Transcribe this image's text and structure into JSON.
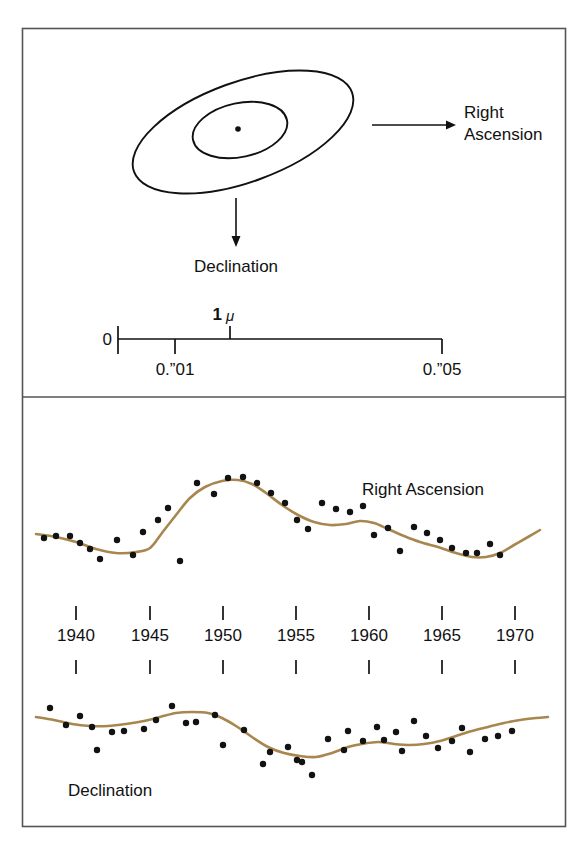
{
  "figure": {
    "background_color": "#ffffff",
    "frame_color": "#4a4a4a",
    "ink_color": "#111111",
    "curve_color": "#a8874f",
    "point_color": "#121212"
  },
  "top_panel": {
    "name": "error-ellipse-diagram",
    "right_ascension_label": "Right",
    "right_ascension_label_line2": "Ascension",
    "declination_label": "Declination",
    "ellipse_outer": {
      "cx": 243,
      "cy": 132,
      "rx": 116,
      "ry": 50,
      "rotation_deg": -20
    },
    "ellipse_inner": {
      "cx": 240,
      "cy": 130,
      "rx": 48,
      "ry": 27,
      "rotation_deg": -12
    },
    "center_dot": {
      "cx": 238,
      "cy": 129,
      "r": 3
    },
    "ra_arrow": {
      "x1": 372,
      "y1": 125,
      "x2": 452,
      "y2": 125
    },
    "dec_arrow": {
      "x1": 236,
      "y1": 198,
      "x2": 236,
      "y2": 243
    },
    "scalebar": {
      "zero_label": "0",
      "mu_label": "1",
      "mu_symbol": "μ",
      "tick_01_label": "0.”01",
      "tick_05_label": "0.”05",
      "x_start": 118,
      "x_end": 442,
      "y": 339
    }
  },
  "divider": {
    "y": 397
  },
  "bottom_panel": {
    "name": "proper-motion-time-series",
    "ra_series_label": "Right Ascension",
    "dec_series_label": "Declination",
    "axis": {
      "tick_labels": [
        "1940",
        "1945",
        "1950",
        "1955",
        "1960",
        "1965",
        "1970"
      ],
      "tick_x": [
        76,
        150,
        223,
        296,
        369,
        442,
        515
      ],
      "label_y": 641,
      "tick_top_y1": 606,
      "tick_top_y2": 620,
      "tick_bottom_y1": 660,
      "tick_bottom_y2": 674
    }
  },
  "chart_data": {
    "type": "scatter",
    "title": "",
    "subtitle": "",
    "xlabel": "",
    "ylabel": "",
    "grid": false,
    "legend_position": "inline-right",
    "xlim": [
      1938,
      1971
    ],
    "x_tick_values": [
      1940,
      1945,
      1950,
      1955,
      1960,
      1965,
      1970
    ],
    "x_tick_labels": [
      "1940",
      "1945",
      "1950",
      "1955",
      "1960",
      "1965",
      "1970"
    ],
    "scalebar": {
      "unit_note": "1 μ",
      "ticks": [
        {
          "label": "0",
          "value": 0.0
        },
        {
          "label": "0.”01",
          "value": 0.01
        },
        {
          "label": "0.”05",
          "value": 0.05
        }
      ]
    },
    "series": [
      {
        "name": "Right Ascension",
        "annotation": "Right Ascension",
        "points_px": [
          [
            44,
            538
          ],
          [
            56,
            536
          ],
          [
            70,
            536
          ],
          [
            80,
            543
          ],
          [
            90,
            549
          ],
          [
            100,
            559
          ],
          [
            117,
            540
          ],
          [
            133,
            555
          ],
          [
            143,
            532
          ],
          [
            158,
            520
          ],
          [
            168,
            508
          ],
          [
            180,
            561
          ],
          [
            197,
            483
          ],
          [
            214,
            494
          ],
          [
            228,
            478
          ],
          [
            243,
            477
          ],
          [
            257,
            483
          ],
          [
            271,
            493
          ],
          [
            285,
            503
          ],
          [
            297,
            520
          ],
          [
            308,
            529
          ],
          [
            322,
            503
          ],
          [
            336,
            509
          ],
          [
            350,
            512
          ],
          [
            363,
            506
          ],
          [
            374,
            535
          ],
          [
            388,
            528
          ],
          [
            400,
            551
          ],
          [
            414,
            527
          ],
          [
            427,
            533
          ],
          [
            440,
            540
          ],
          [
            452,
            548
          ],
          [
            466,
            553
          ],
          [
            477,
            553
          ],
          [
            490,
            544
          ],
          [
            500,
            555
          ]
        ],
        "fit_curve_px": [
          [
            36,
            534
          ],
          [
            56,
            537
          ],
          [
            76,
            542
          ],
          [
            96,
            549
          ],
          [
            116,
            553
          ],
          [
            136,
            552
          ],
          [
            150,
            548
          ],
          [
            162,
            533
          ],
          [
            176,
            515
          ],
          [
            190,
            498
          ],
          [
            205,
            487
          ],
          [
            222,
            481
          ],
          [
            238,
            480
          ],
          [
            252,
            484
          ],
          [
            266,
            493
          ],
          [
            282,
            505
          ],
          [
            298,
            515
          ],
          [
            314,
            522
          ],
          [
            330,
            525
          ],
          [
            346,
            524
          ],
          [
            360,
            521
          ],
          [
            374,
            523
          ],
          [
            388,
            529
          ],
          [
            404,
            536
          ],
          [
            420,
            542
          ],
          [
            438,
            547
          ],
          [
            456,
            553
          ],
          [
            472,
            557
          ],
          [
            486,
            557
          ],
          [
            500,
            553
          ],
          [
            514,
            545
          ],
          [
            528,
            537
          ],
          [
            540,
            530
          ]
        ]
      },
      {
        "name": "Declination",
        "annotation": "Declination",
        "points_px": [
          [
            50,
            708
          ],
          [
            66,
            725
          ],
          [
            80,
            716
          ],
          [
            92,
            727
          ],
          [
            97,
            750
          ],
          [
            112,
            732
          ],
          [
            124,
            731
          ],
          [
            144,
            729
          ],
          [
            156,
            720
          ],
          [
            172,
            706
          ],
          [
            186,
            723
          ],
          [
            196,
            722
          ],
          [
            215,
            715
          ],
          [
            223,
            745
          ],
          [
            244,
            730
          ],
          [
            263,
            764
          ],
          [
            270,
            752
          ],
          [
            288,
            747
          ],
          [
            297,
            760
          ],
          [
            302,
            762
          ],
          [
            312,
            775
          ],
          [
            328,
            739
          ],
          [
            344,
            750
          ],
          [
            348,
            731
          ],
          [
            363,
            741
          ],
          [
            377,
            727
          ],
          [
            384,
            740
          ],
          [
            396,
            732
          ],
          [
            402,
            751
          ],
          [
            414,
            721
          ],
          [
            426,
            736
          ],
          [
            438,
            748
          ],
          [
            452,
            741
          ],
          [
            462,
            728
          ],
          [
            470,
            752
          ],
          [
            485,
            739
          ],
          [
            498,
            736
          ],
          [
            512,
            731
          ]
        ],
        "fit_curve_px": [
          [
            36,
            717
          ],
          [
            54,
            720
          ],
          [
            72,
            724
          ],
          [
            90,
            726
          ],
          [
            108,
            726
          ],
          [
            126,
            724
          ],
          [
            144,
            721
          ],
          [
            160,
            717
          ],
          [
            176,
            713
          ],
          [
            192,
            712
          ],
          [
            208,
            713
          ],
          [
            222,
            718
          ],
          [
            236,
            726
          ],
          [
            252,
            737
          ],
          [
            268,
            747
          ],
          [
            284,
            753
          ],
          [
            300,
            756
          ],
          [
            316,
            757
          ],
          [
            332,
            753
          ],
          [
            348,
            747
          ],
          [
            362,
            744
          ],
          [
            378,
            742
          ],
          [
            394,
            744
          ],
          [
            410,
            745
          ],
          [
            424,
            744
          ],
          [
            440,
            741
          ],
          [
            456,
            736
          ],
          [
            472,
            731
          ],
          [
            488,
            727
          ],
          [
            504,
            723
          ],
          [
            520,
            720
          ],
          [
            536,
            718
          ],
          [
            548,
            717
          ]
        ]
      }
    ]
  }
}
